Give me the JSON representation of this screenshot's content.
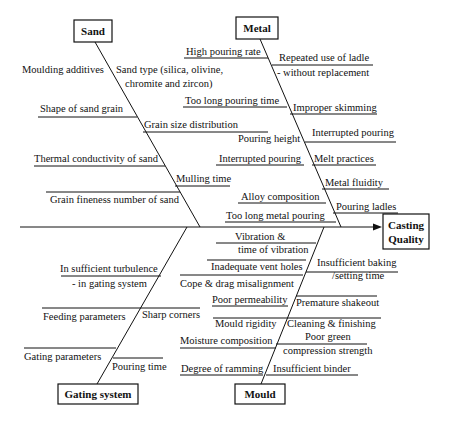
{
  "diagram": {
    "type": "fishbone",
    "effect": {
      "line1": "Casting",
      "line2": "Quality"
    },
    "categories": {
      "sand": {
        "title": "Sand",
        "causes": [
          "Moulding additives",
          "Sand type (silica, olivine,",
          "chromite and zircon)",
          "Shape of sand grain",
          "Grain size distribution",
          "Thermal conductivity of sand",
          "Mulling time",
          "Grain fineness number of sand"
        ]
      },
      "metal": {
        "title": "Metal",
        "causes": [
          "High pouring rate",
          "Repeated use of ladle",
          "- without replacement",
          "Too long pouring time",
          "Improper skimming",
          "Pouring height",
          "Interrupted pouring",
          "Interrupted pouring",
          "Melt practices",
          "Metal fluidity",
          "Alloy composition",
          "Pouring ladles",
          "Too long metal pouring"
        ]
      },
      "gating": {
        "title": "Gating system",
        "causes": [
          "In sufficient turbulence",
          "- in gating system",
          "Feeding parameters",
          "Sharp corners",
          "Gating parameters",
          "Pouring time"
        ]
      },
      "mould": {
        "title": "Mould",
        "causes": [
          "Vibration &",
          "time of vibration",
          "Inadequate vent holes",
          "Insufficient baking",
          "/setting time",
          "Cope & drag misalignment",
          "Poor permeability",
          "Premature shakeout",
          "Mould rigidity",
          "Cleaning & finishing",
          "Moisture composition",
          "Poor green",
          "compression strength",
          "Degree of ramming",
          "Insufficient binder"
        ]
      }
    }
  }
}
